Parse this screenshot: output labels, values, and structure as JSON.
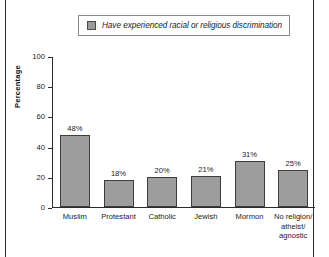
{
  "legend": {
    "label": "Have experienced racial or religious discrimination",
    "swatch_color": "#9d9d9d"
  },
  "axis": {
    "ylabel": "Percentage",
    "yticks": [
      "0",
      "20",
      "40",
      "60",
      "80",
      "100"
    ]
  },
  "chart_data": {
    "type": "bar",
    "title": "",
    "xlabel": "",
    "ylabel": "Percentage",
    "ylim": [
      0,
      100
    ],
    "yticks": [
      0,
      20,
      40,
      60,
      80,
      100
    ],
    "grid": false,
    "legend_position": "top-center",
    "categories": [
      "Muslim",
      "Protestant",
      "Catholic",
      "Jewish",
      "Mormon",
      "No religion/\natheist/\nagnostic"
    ],
    "category_lines": [
      [
        "Muslim"
      ],
      [
        "Protestant"
      ],
      [
        "Catholic"
      ],
      [
        "Jewish"
      ],
      [
        "Mormon"
      ],
      [
        "No religion/",
        "atheist/",
        "agnostic"
      ]
    ],
    "series": [
      {
        "name": "Have experienced racial or religious discrimination",
        "color": "#9d9d9d",
        "values": [
          48,
          18,
          20,
          21,
          31,
          25
        ],
        "data_labels": [
          "48%",
          "18%",
          "20%",
          "21%",
          "31%",
          "25%"
        ]
      }
    ]
  }
}
